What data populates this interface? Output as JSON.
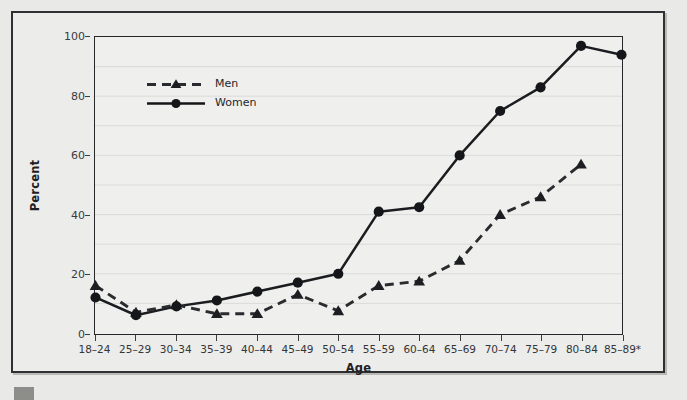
{
  "figure": {
    "ylabel": "Percent",
    "xlabel": "Age",
    "background": "#ececea",
    "axis_color": "#26272a",
    "grid_color": "#d8d8d6"
  },
  "legend": {
    "position": "upper-left-inside",
    "entries": [
      {
        "label": "Men",
        "style": "dashed-line-with-triangle-marker",
        "color": "#2a2b2e"
      },
      {
        "label": "Women",
        "style": "solid-line-with-circle-marker",
        "color": "#151619"
      }
    ]
  },
  "chart_data": {
    "type": "line",
    "title": "",
    "subtitle": "",
    "xlabel": "Age",
    "ylabel": "Percent",
    "ylim": [
      0,
      100
    ],
    "yticks": [
      0,
      20,
      40,
      60,
      80,
      100
    ],
    "ytick_labels": [
      "0",
      "20",
      "40",
      "60",
      "80",
      "100"
    ],
    "grid": "horizontal",
    "categories": [
      "18–24",
      "25–29",
      "30–34",
      "35–39",
      "40–44",
      "45–49",
      "50–54",
      "55–59",
      "60–64",
      "65–69",
      "70–74",
      "75–79",
      "80–84",
      "85–89*"
    ],
    "series": [
      {
        "name": "Men",
        "marker": "triangle",
        "line": "dashed",
        "values": [
          16,
          7,
          9.5,
          6.5,
          6.5,
          13,
          7.5,
          16,
          17.5,
          24.5,
          40,
          46,
          57,
          null
        ]
      },
      {
        "name": "Women",
        "marker": "circle",
        "line": "solid",
        "values": [
          12,
          6,
          9,
          11,
          14,
          17,
          20,
          41,
          42.5,
          60,
          75,
          83,
          97,
          94
        ]
      }
    ],
    "annotations": [
      "* denotes age group 85–89"
    ]
  }
}
